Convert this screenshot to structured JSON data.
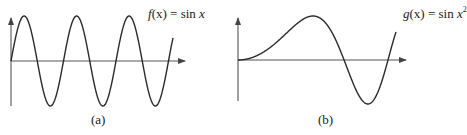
{
  "chart_data": [
    {
      "type": "line",
      "panel": "(a)",
      "title": "f(x) = sin x",
      "function_name": "f",
      "function_arg": "x",
      "function_body": "sin",
      "function_exponent": "",
      "caption": "(a)",
      "xlabel": "",
      "ylabel": "",
      "grid": false,
      "x_range": [
        0,
        6.2
      ],
      "y_range": [
        -1,
        1
      ],
      "description": "Sine wave with constant frequency: three full peaks and three troughs starting at origin",
      "peaks_x": [
        1.571,
        7.854,
        14.137
      ],
      "troughs_x": [
        4.712,
        11.0,
        17.279
      ]
    },
    {
      "type": "line",
      "panel": "(b)",
      "title": "g(x) = sin x^2",
      "function_name": "g",
      "function_arg": "x",
      "function_body": "sin",
      "function_exponent": "2",
      "caption": "(b)",
      "xlabel": "",
      "ylabel": "",
      "grid": false,
      "y_range": [
        -1,
        1
      ],
      "description": "sin(x^2): flat near origin, one broad hump, then oscillations of increasing frequency"
    }
  ],
  "panels": {
    "a": {
      "label_fn": "f",
      "label_arg": "(x)",
      "label_eq": " = sin ",
      "label_var": "x",
      "caption": "(a)"
    },
    "b": {
      "label_fn": "g",
      "label_arg": "(x)",
      "label_eq": " = sin ",
      "label_var": "x",
      "label_exp": "2",
      "caption": "(b)"
    }
  },
  "colors": {
    "curve": "#2a2a2a",
    "axis": "#555555",
    "background": "#ffffff"
  }
}
